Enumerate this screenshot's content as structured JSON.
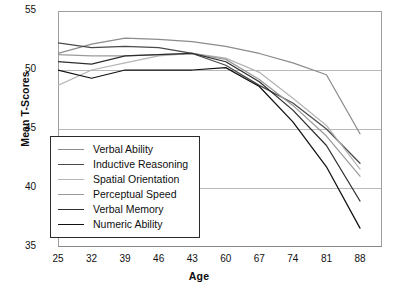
{
  "chart_data": {
    "type": "line",
    "title": "",
    "xlabel": "Age",
    "ylabel": "Mean T-Scores",
    "x": [
      25,
      32,
      39,
      46,
      43,
      60,
      67,
      74,
      81,
      88
    ],
    "xticklabels": [
      "25",
      "32",
      "39",
      "46",
      "43",
      "60",
      "67",
      "74",
      "81",
      "88"
    ],
    "yticklabels": [
      "35",
      "40",
      "45",
      "50",
      "55"
    ],
    "ylim": [
      35,
      55
    ],
    "ytickvalues": [
      35,
      40,
      45,
      50,
      55
    ],
    "grid": true,
    "legend_position": "inside-lower-left",
    "series": [
      {
        "name": "Verbal Ability",
        "color": "#8c8c8c",
        "values": [
          51.4,
          52.2,
          52.7,
          52.6,
          52.4,
          52.0,
          51.4,
          50.6,
          49.6,
          44.6
        ]
      },
      {
        "name": "Inductive Reasoning",
        "color": "#4a4a4a",
        "values": [
          52.3,
          51.9,
          52.0,
          51.9,
          51.4,
          50.4,
          48.7,
          47.2,
          45.0,
          42.1
        ]
      },
      {
        "name": "Spatial Orientation",
        "color": "#b5b5b5",
        "values": [
          48.7,
          50.0,
          50.6,
          51.2,
          51.4,
          51.0,
          49.8,
          47.6,
          45.3,
          41.6
        ]
      },
      {
        "name": "Perceptual Speed",
        "color": "#9a9a9a",
        "values": [
          51.3,
          51.2,
          51.2,
          51.3,
          51.4,
          50.9,
          49.2,
          47.0,
          44.4,
          41.0
        ]
      },
      {
        "name": "Verbal Memory",
        "color": "#2e2e2e",
        "values": [
          50.7,
          50.5,
          51.2,
          51.3,
          51.4,
          50.7,
          49.0,
          46.6,
          43.6,
          38.9
        ]
      },
      {
        "name": "Numeric Ability",
        "color": "#111111",
        "values": [
          50.0,
          49.3,
          50.0,
          50.0,
          50.0,
          50.2,
          48.6,
          45.6,
          41.8,
          36.6
        ]
      }
    ]
  }
}
